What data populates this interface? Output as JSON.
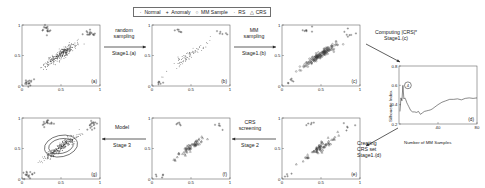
{
  "figure": {
    "title": "",
    "legend": {
      "items": [
        {
          "symbol": "·",
          "label": "Normal"
        },
        {
          "symbol": "+",
          "label": "Anomaly"
        },
        {
          "symbol": "○",
          "label": "MM Sample"
        },
        {
          "symbol": "·",
          "label": "RS"
        },
        {
          "symbol": "△",
          "label": "CRS"
        }
      ]
    },
    "arrows": [
      {
        "id": "arrow-random-sampling",
        "top": "random",
        "top2": "sampling",
        "bottom": "Stage1.(a)",
        "dir": "right"
      },
      {
        "id": "arrow-mm-sampling",
        "top": "MM",
        "top2": "sampling",
        "bottom": "Stage1.(b)",
        "dir": "right"
      },
      {
        "id": "arrow-computing-crs",
        "top": "Computing |CRS|*",
        "top2": "Stage1.(c)",
        "bottom": "",
        "dir": "down-right"
      },
      {
        "id": "arrow-creating-crs-set",
        "top": "Creating",
        "top2": "CRS set",
        "bottom": "Stage1.(d)",
        "dir": "up-left"
      },
      {
        "id": "arrow-crs-screening",
        "top": "CRS",
        "top2": "screening",
        "bottom": "Stage 2",
        "dir": "left"
      },
      {
        "id": "arrow-model",
        "top": "Model",
        "top2": "",
        "bottom": "Stage 3",
        "dir": "left"
      }
    ],
    "axis_ticks": {
      "x": [
        "0",
        "0.5",
        "1"
      ],
      "y": [
        "0",
        "0.5",
        "1"
      ]
    }
  },
  "chart_data": [
    {
      "id": "panel-a",
      "type": "scatter",
      "panel_label": "(a)",
      "title": "",
      "xlabel": "",
      "ylabel": "",
      "xlim": [
        0,
        1
      ],
      "ylim": [
        0,
        1
      ],
      "xticks": [
        "0",
        "0.5",
        "1"
      ],
      "yticks": [
        "0",
        "0.5",
        "1"
      ],
      "grid": false,
      "series": [
        {
          "name": "Normal",
          "symbol": "dot",
          "n": 300,
          "cluster": {
            "cx": 0.5,
            "cy": 0.52,
            "sx": 0.115,
            "sy": 0.105,
            "rho": 0.93
          }
        },
        {
          "name": "Anomaly",
          "symbol": "plus",
          "n": 46,
          "clusters": [
            {
              "cx": 0.32,
              "cy": 0.93,
              "sx": 0.035,
              "sy": 0.035
            },
            {
              "cx": 0.09,
              "cy": 0.07,
              "sx": 0.035,
              "sy": 0.03
            },
            {
              "cx": 0.88,
              "cy": 0.87,
              "sx": 0.045,
              "sy": 0.045
            }
          ]
        }
      ]
    },
    {
      "id": "panel-b",
      "type": "scatter",
      "panel_label": "(b)",
      "xlim": [
        0,
        1
      ],
      "ylim": [
        0,
        1
      ],
      "xticks": [
        "0",
        "0.5",
        "1"
      ],
      "yticks": [
        "0",
        "0.5",
        "1"
      ],
      "grid": false,
      "series": [
        {
          "name": "RS",
          "symbol": "dot",
          "n": 80,
          "cluster": {
            "cx": 0.49,
            "cy": 0.51,
            "sx": 0.11,
            "sy": 0.1,
            "rho": 0.93
          }
        },
        {
          "name": "Anomaly",
          "symbol": "plus",
          "n": 18,
          "clusters": [
            {
              "cx": 0.33,
              "cy": 0.9,
              "sx": 0.04,
              "sy": 0.035
            },
            {
              "cx": 0.1,
              "cy": 0.07,
              "sx": 0.035,
              "sy": 0.028
            },
            {
              "cx": 0.87,
              "cy": 0.86,
              "sx": 0.045,
              "sy": 0.04
            }
          ]
        }
      ]
    },
    {
      "id": "panel-c",
      "type": "scatter",
      "panel_label": "(c)",
      "xlim": [
        0,
        1
      ],
      "ylim": [
        0,
        1
      ],
      "xticks": [
        "0",
        "0.5",
        "1"
      ],
      "yticks": [
        "0",
        "0.5",
        "1"
      ],
      "grid": false,
      "series": [
        {
          "name": "MM Sample",
          "symbol": "circle",
          "n": 150,
          "cluster": {
            "cx": 0.48,
            "cy": 0.5,
            "sx": 0.105,
            "sy": 0.095,
            "rho": 0.93
          }
        },
        {
          "name": "Anomaly",
          "symbol": "plus",
          "n": 20,
          "clusters": [
            {
              "cx": 0.33,
              "cy": 0.92,
              "sx": 0.045,
              "sy": 0.03
            },
            {
              "cx": 0.1,
              "cy": 0.07,
              "sx": 0.04,
              "sy": 0.03
            },
            {
              "cx": 0.87,
              "cy": 0.86,
              "sx": 0.045,
              "sy": 0.04
            }
          ]
        }
      ]
    },
    {
      "id": "panel-d",
      "type": "line",
      "panel_label": "(d)",
      "title": "",
      "xlabel": "Number of MM Samples",
      "ylabel": "Silhouette Index",
      "xlim": [
        0,
        80
      ],
      "ylim": [
        0.2,
        0.8
      ],
      "xticks": [
        "40",
        "80"
      ],
      "yticks": [
        "0.2",
        "0.4",
        "0.6",
        "0.8"
      ],
      "grid": false,
      "annotation": {
        "label": "4",
        "x": 4,
        "y": 0.6,
        "shape": "circle"
      },
      "x": [
        1,
        2,
        3,
        4,
        5,
        6,
        7,
        8,
        9,
        10,
        12,
        14,
        16,
        18,
        20,
        22,
        24,
        26,
        28,
        30,
        32,
        34,
        36,
        38,
        40,
        44,
        48,
        52,
        56,
        60,
        64,
        68,
        72,
        76,
        80
      ],
      "y": [
        0.33,
        0.47,
        0.44,
        0.6,
        0.46,
        0.47,
        0.45,
        0.42,
        0.4,
        0.38,
        0.34,
        0.325,
        0.325,
        0.32,
        0.33,
        0.3,
        0.315,
        0.33,
        0.335,
        0.34,
        0.345,
        0.355,
        0.37,
        0.385,
        0.4,
        0.425,
        0.44,
        0.455,
        0.455,
        0.46,
        0.45,
        0.465,
        0.47,
        0.465,
        0.47
      ]
    },
    {
      "id": "panel-e",
      "type": "scatter",
      "panel_label": "(e)",
      "xlim": [
        0,
        1
      ],
      "ylim": [
        0,
        1
      ],
      "xticks": [
        "0",
        "0.5",
        "1"
      ],
      "yticks": [
        "0",
        "0.5",
        "1"
      ],
      "grid": false,
      "series": [
        {
          "name": "CRS",
          "symbol": "triangle",
          "n": 70,
          "cluster": {
            "cx": 0.49,
            "cy": 0.51,
            "sx": 0.105,
            "sy": 0.095,
            "rho": 0.93
          }
        },
        {
          "name": "Anomaly",
          "symbol": "plus",
          "n": 16,
          "clusters": [
            {
              "cx": 0.34,
              "cy": 0.9,
              "sx": 0.045,
              "sy": 0.03
            },
            {
              "cx": 0.1,
              "cy": 0.07,
              "sx": 0.04,
              "sy": 0.028
            },
            {
              "cx": 0.86,
              "cy": 0.85,
              "sx": 0.045,
              "sy": 0.04
            }
          ]
        }
      ]
    },
    {
      "id": "panel-f",
      "type": "scatter",
      "panel_label": "(f)",
      "xlim": [
        0,
        1
      ],
      "ylim": [
        0,
        1
      ],
      "xticks": [
        "0",
        "0.5",
        "1"
      ],
      "yticks": [
        "0",
        "0.5",
        "1"
      ],
      "grid": false,
      "series": [
        {
          "name": "CRS",
          "symbol": "triangle",
          "n": 60,
          "cluster": {
            "cx": 0.47,
            "cy": 0.5,
            "sx": 0.1,
            "sy": 0.092,
            "rho": 0.93
          }
        },
        {
          "name": "Anomaly",
          "symbol": "plus",
          "n": 14,
          "clusters": [
            {
              "cx": 0.33,
              "cy": 0.9,
              "sx": 0.045,
              "sy": 0.03
            },
            {
              "cx": 0.1,
              "cy": 0.07,
              "sx": 0.04,
              "sy": 0.028
            },
            {
              "cx": 0.86,
              "cy": 0.85,
              "sx": 0.045,
              "sy": 0.04
            }
          ]
        }
      ]
    },
    {
      "id": "panel-g",
      "type": "scatter",
      "panel_label": "(g)",
      "xlim": [
        0,
        1
      ],
      "ylim": [
        0,
        1
      ],
      "xticks": [
        "0",
        "0.5",
        "1"
      ],
      "yticks": [
        "0",
        "0.5",
        "1"
      ],
      "grid": false,
      "model_boundaries": [
        {
          "cx": 0.5,
          "cy": 0.54,
          "rx": 0.215,
          "ry": 0.175,
          "rot": -12
        },
        {
          "cx": 0.5,
          "cy": 0.54,
          "rx": 0.16,
          "ry": 0.12,
          "rot": -12
        }
      ],
      "series": [
        {
          "name": "Normal",
          "symbol": "dot",
          "n": 300,
          "cluster": {
            "cx": 0.5,
            "cy": 0.52,
            "sx": 0.115,
            "sy": 0.105,
            "rho": 0.93
          }
        },
        {
          "name": "Anomaly",
          "symbol": "plus",
          "n": 46,
          "clusters": [
            {
              "cx": 0.32,
              "cy": 0.93,
              "sx": 0.035,
              "sy": 0.035
            },
            {
              "cx": 0.09,
              "cy": 0.07,
              "sx": 0.035,
              "sy": 0.03
            },
            {
              "cx": 0.88,
              "cy": 0.87,
              "sx": 0.045,
              "sy": 0.045
            }
          ]
        }
      ]
    }
  ]
}
